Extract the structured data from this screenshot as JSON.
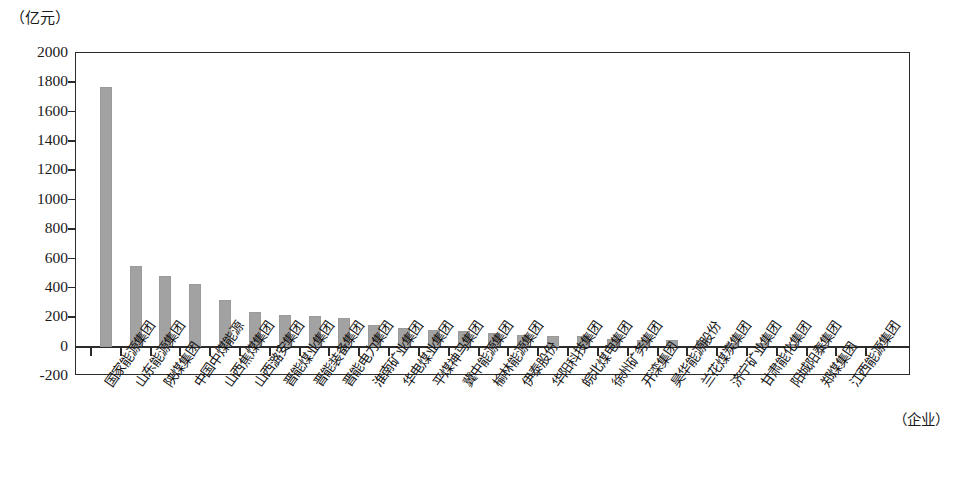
{
  "chart_data": {
    "type": "bar",
    "title": "",
    "subtitle": "",
    "unit_label": "（亿元）",
    "ylabel": "亿元",
    "xlabel": "（企业）",
    "ylim": [
      -200,
      2000
    ],
    "ystep": 200,
    "grid": false,
    "legend": null,
    "bar_color": "#a2a2a2",
    "axis_color": "#2b2b2b",
    "ytick_labels": [
      "2000",
      "1800",
      "1600",
      "1400",
      "1200",
      "1000",
      "800",
      "600",
      "400",
      "200",
      "0",
      "-200"
    ],
    "ytick_values": [
      2000,
      1800,
      1600,
      1400,
      1200,
      1000,
      800,
      600,
      400,
      200,
      0,
      -200
    ],
    "categories": [
      "国家能源集团",
      "山东能源集团",
      "陕煤集团",
      "中国中煤能源",
      "山西焦煤集团",
      "山西潞安集团",
      "晋能煤业集团",
      "晋能装备集团",
      "晋能电力集团",
      "淮南矿业集团",
      "华电煤业集团",
      "平煤神马集团",
      "冀中能源集团",
      "榆林能源集团",
      "伊泰股份",
      "华阳科技集团",
      "皖北煤电集团",
      "徐州矿务集团",
      "开滦集团",
      "昊华能源股份",
      "兰花煤炭集团",
      "济宁矿业集团",
      "甘肃能化集团",
      "阳城阳泰集团",
      "郑煤集团",
      "江西能源集团"
    ],
    "values": [
      1770,
      550,
      480,
      430,
      320,
      235,
      215,
      210,
      195,
      145,
      125,
      115,
      105,
      90,
      80,
      75,
      70,
      55,
      48,
      45,
      42,
      28,
      22,
      15,
      10,
      8
    ]
  }
}
